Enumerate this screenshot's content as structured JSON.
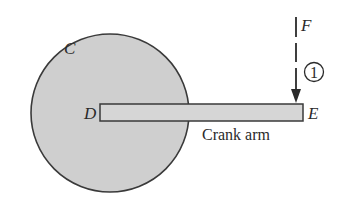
{
  "figure": {
    "width": 349,
    "height": 209,
    "background": "#ffffff",
    "stroke_color": "#3a3a3a",
    "fill_color": "#cfcfcf"
  },
  "disk": {
    "label": "C",
    "cx": 110,
    "cy": 113,
    "r": 79
  },
  "crank_arm": {
    "caption": "Crank arm",
    "x": 100,
    "y": 104,
    "width": 203,
    "height": 17,
    "end_left_label": "D",
    "end_right_label": "E"
  },
  "force": {
    "label": "F",
    "marker": "1",
    "x": 296,
    "y_start": 17,
    "y_end": 103
  }
}
